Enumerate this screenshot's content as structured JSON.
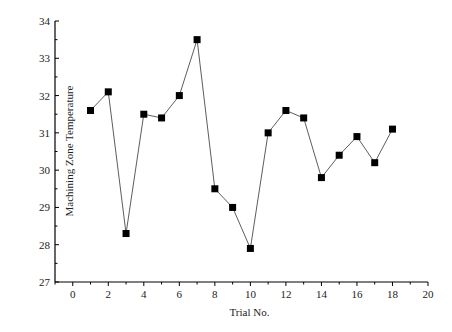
{
  "chart_data": {
    "type": "line",
    "title": "",
    "xlabel": "Trial No.",
    "ylabel": "Machining Zone Temperature",
    "x": [
      1,
      2,
      3,
      4,
      5,
      6,
      7,
      8,
      9,
      10,
      11,
      12,
      13,
      14,
      15,
      16,
      17,
      18
    ],
    "series": [
      {
        "name": "Machining Zone Temperature",
        "values": [
          31.6,
          32.1,
          28.3,
          31.5,
          31.4,
          32.0,
          33.5,
          29.5,
          29.0,
          27.9,
          31.0,
          31.6,
          31.4,
          29.8,
          30.4,
          30.9,
          30.2,
          31.1
        ],
        "marker": "square",
        "color": "#000000"
      }
    ],
    "xlim": [
      -1,
      20
    ],
    "ylim": [
      27,
      34
    ],
    "xticks": [
      0,
      2,
      4,
      6,
      8,
      10,
      12,
      14,
      16,
      18,
      20
    ],
    "yticks": [
      27,
      28,
      29,
      30,
      31,
      32,
      33,
      34
    ],
    "grid": false,
    "legend": null
  }
}
